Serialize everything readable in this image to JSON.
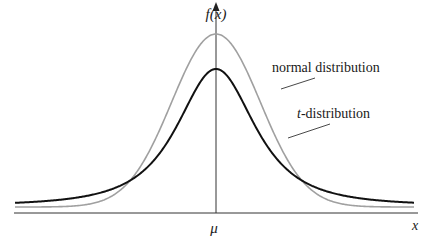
{
  "chart_data": {
    "type": "line",
    "title": "",
    "xlabel": "x",
    "ylabel": "f(x)",
    "x_tick_labels": [
      {
        "position": 0,
        "label": "μ"
      }
    ],
    "grid": false,
    "legend": "inline labels with leader lines",
    "x_range": [
      -4.5,
      4.5
    ],
    "series": [
      {
        "name": "normal distribution",
        "kind": "normal",
        "color": "#a0a0a0",
        "peak_height_px": 179,
        "params": {
          "mu": 0,
          "sigma": 1
        },
        "label": "normal distribution"
      },
      {
        "name": "t-distribution",
        "kind": "student_t",
        "color": "#111111",
        "peak_height_px": 144,
        "params": {
          "mu": 0,
          "df": 2
        },
        "label_italic": "t",
        "label_rest": "-distribution"
      }
    ]
  },
  "labels": {
    "y_axis": "f(x)",
    "x_axis": "x",
    "mu": "μ",
    "normal": "normal distribution",
    "t_italic": "t",
    "t_rest": "-distribution"
  },
  "colors": {
    "normal": "#a0a0a0",
    "t": "#111111",
    "axis": "#333333"
  }
}
